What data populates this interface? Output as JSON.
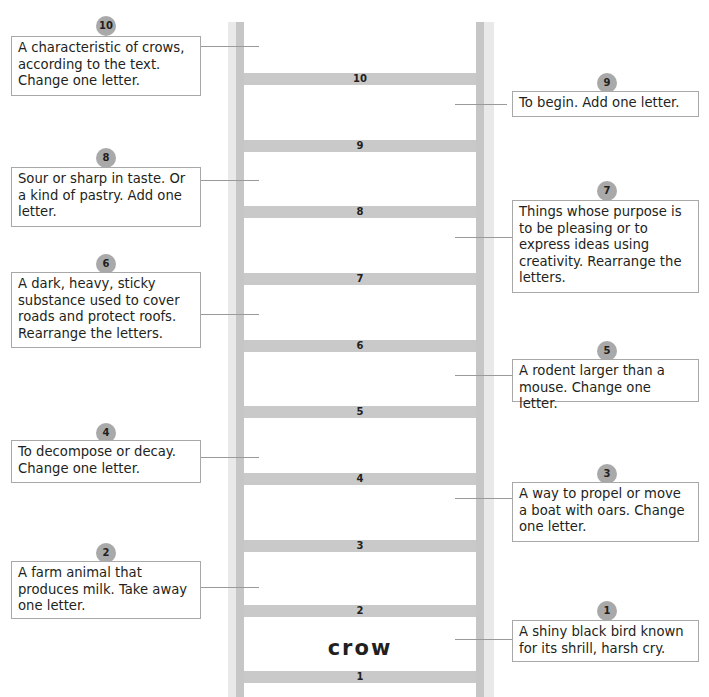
{
  "ladder": {
    "start_word": "crow",
    "rungs": [
      "1",
      "2",
      "3",
      "4",
      "5",
      "6",
      "7",
      "8",
      "9",
      "10"
    ],
    "colors": {
      "rail_outer": "#e9e9e9",
      "rail_inner": "#c6c6c6",
      "rung": "#c9c9c9",
      "badge": "#a9a9a9",
      "border": "#a8a8a8"
    }
  },
  "clues": [
    {
      "number": "1",
      "side": "right",
      "text": "A shiny black bird known for its shrill, harsh cry."
    },
    {
      "number": "2",
      "side": "left",
      "text": "A farm animal that produces milk.  Take away one letter."
    },
    {
      "number": "3",
      "side": "right",
      "text": "A way to propel or move a boat with oars.  Change one letter."
    },
    {
      "number": "4",
      "side": "left",
      "text": "To decompose or decay.  Change one letter."
    },
    {
      "number": "5",
      "side": "right",
      "text": "A rodent larger than a mouse.  Change one letter."
    },
    {
      "number": "6",
      "side": "left",
      "text": "A dark, heavy, sticky substance used to cover roads and protect roofs.  Rearrange the letters."
    },
    {
      "number": "7",
      "side": "right",
      "text": "Things whose purpose is to be pleasing or to express ideas using creativity.  Rearrange the letters."
    },
    {
      "number": "8",
      "side": "left",
      "text": "Sour or sharp in taste.  Or a kind of pastry.  Add one letter."
    },
    {
      "number": "9",
      "side": "right",
      "text": "To begin.  Add one letter."
    },
    {
      "number": "10",
      "side": "left",
      "text": "A characteristic of crows, according to the text.  Change one letter."
    }
  ]
}
